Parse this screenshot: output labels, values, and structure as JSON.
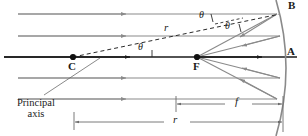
{
  "figure": {
    "kind": "concave-mirror-ray-diagram",
    "colors": {
      "ray": "#8a8a8a",
      "axis": "#1a1a1a",
      "mirror": "#8a8a8a",
      "dashed": "#2b2b2b",
      "dimension": "#6b6b6b",
      "text": "#1a1a1a",
      "background": "#ffffff"
    }
  },
  "points": {
    "vertex": {
      "label": "A",
      "x": 290,
      "y": 52
    },
    "top_of_mirror": {
      "label": "B",
      "x": 290,
      "y": 4
    },
    "center_of_curvature": {
      "label": "C",
      "x": 69,
      "y": 61
    },
    "focal_point": {
      "label": "F",
      "x": 194,
      "y": 61
    }
  },
  "angles": [
    {
      "label": "θ",
      "x": 138,
      "y": 42,
      "name": "theta-at-center"
    },
    {
      "label": "θ",
      "x": 199,
      "y": 11,
      "name": "theta-incident"
    },
    {
      "label": "θ",
      "x": 225,
      "y": 22,
      "name": "theta-reflected"
    }
  ],
  "segments": {
    "radius_on_dashed": {
      "label": "r",
      "x": 165,
      "y": 22
    },
    "focal_length_dimension": {
      "label": "f",
      "x": 238,
      "y": 100
    },
    "radius_dimension": {
      "label": "r",
      "x": 175,
      "y": 116
    }
  },
  "annotations": {
    "principal_axis": {
      "line1": "Principal",
      "line2": "axis",
      "x": 6,
      "y": 100
    }
  },
  "rays": {
    "count": 5,
    "y_positions": [
      14,
      36,
      57,
      78,
      99
    ],
    "direction": "left-to-right",
    "description": "parallel incident rays"
  },
  "mirror": {
    "description": "concave spherical mirror arc, opening toward the left",
    "vertex_x": 283,
    "top_y": 8,
    "bottom_y": 134
  }
}
